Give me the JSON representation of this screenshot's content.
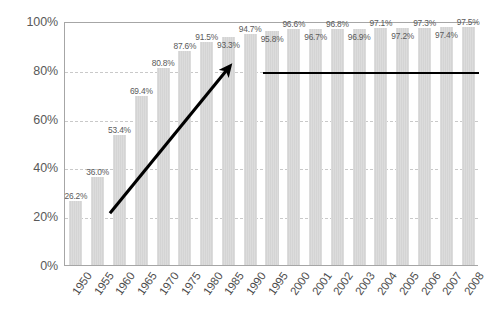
{
  "chart_data": {
    "type": "bar",
    "title": "",
    "subtitle": "",
    "xlabel": "",
    "ylabel": "",
    "ylim": [
      0,
      100
    ],
    "yticks": [
      "0%",
      "20%",
      "40%",
      "60%",
      "80%",
      "100%"
    ],
    "ytick_values": [
      0,
      20,
      40,
      60,
      80,
      100
    ],
    "grid": true,
    "legend": "none",
    "categories": [
      "1950",
      "1955",
      "1960",
      "1965",
      "1970",
      "1975",
      "1980",
      "1985",
      "1990",
      "1995",
      "2000",
      "2001",
      "2002",
      "2003",
      "2004",
      "2005",
      "2006",
      "2007",
      "2008"
    ],
    "values": [
      26.2,
      36.0,
      53.4,
      69.4,
      80.8,
      87.6,
      91.5,
      93.3,
      94.7,
      95.8,
      96.6,
      96.7,
      96.8,
      96.9,
      97.1,
      97.2,
      97.3,
      97.4,
      97.5
    ],
    "data_labels": [
      "26.2%",
      "36.0%",
      "53.4%",
      "69.4%",
      "80.8%",
      "87.6%",
      "91.5%",
      "93.3%",
      "94.7%",
      "95.8%",
      "96.6%",
      "96.7%",
      "96.8%",
      "96.9%",
      "97.1%",
      "97.2%",
      "97.3%",
      "97.4%",
      "97.5%"
    ],
    "annotations": [
      {
        "name": "growth-trend-arrow",
        "type": "arrow",
        "from_category": "1960",
        "to_category": "1985",
        "from_value": 22.0,
        "to_value": 80.5,
        "color": "#000000"
      },
      {
        "name": "saturation-benchmark-line",
        "type": "horizontal-line",
        "value": 80.0,
        "from_category": "1995",
        "to_category": "2008",
        "color": "#000000"
      }
    ]
  },
  "colors": {
    "bar": "#d9d9d9",
    "axis": "#a6a6a6",
    "gridline": "#c9c9c9",
    "label_text": "#5a5a5a",
    "tick_text": "#4d4d4d",
    "annotation": "#000000"
  }
}
